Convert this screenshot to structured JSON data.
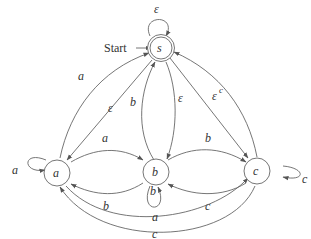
{
  "diagram": {
    "type": "state-machine",
    "start_label": "Start",
    "states": [
      {
        "id": "s",
        "label": "s",
        "accepting": true,
        "start": true
      },
      {
        "id": "a",
        "label": "a",
        "accepting": false
      },
      {
        "id": "b",
        "label": "b",
        "accepting": false
      },
      {
        "id": "c",
        "label": "c",
        "accepting": false
      }
    ],
    "transitions": [
      {
        "from": "s",
        "to": "s",
        "label": "ε"
      },
      {
        "from": "a",
        "to": "a",
        "label": "a"
      },
      {
        "from": "b",
        "to": "b",
        "label": "b"
      },
      {
        "from": "c",
        "to": "c",
        "label": "c"
      },
      {
        "from": "a",
        "to": "s",
        "label": "a"
      },
      {
        "from": "s",
        "to": "a",
        "label": "ε"
      },
      {
        "from": "b",
        "to": "s",
        "label": "b"
      },
      {
        "from": "s",
        "to": "b",
        "label": "ε"
      },
      {
        "from": "s",
        "to": "c",
        "label": "ε"
      },
      {
        "from": "c",
        "to": "s",
        "label": "c"
      },
      {
        "from": "a",
        "to": "b",
        "label": "a"
      },
      {
        "from": "b",
        "to": "a",
        "label": "b"
      },
      {
        "from": "b",
        "to": "c",
        "label": "b"
      },
      {
        "from": "c",
        "to": "b",
        "label": "c"
      },
      {
        "from": "a",
        "to": "c",
        "label": "a"
      },
      {
        "from": "c",
        "to": "a",
        "label": "c"
      }
    ]
  }
}
